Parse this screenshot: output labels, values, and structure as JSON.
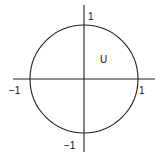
{
  "diagram": {
    "type": "unit-circle",
    "region_label": "U",
    "axis_labels": {
      "x_positive": "1",
      "x_negative": "−1",
      "y_positive": "1",
      "y_negative": "−1"
    },
    "colors": {
      "stroke": "#222222",
      "background": "#ffffff"
    }
  }
}
